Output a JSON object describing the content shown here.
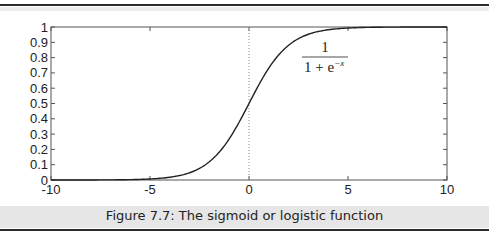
{
  "caption": "Figure 7.7: The sigmoid or logistic function",
  "formula": {
    "numerator": "1",
    "denominator_base": "1 + e",
    "denominator_exp": "−x"
  },
  "chart_data": {
    "type": "line",
    "title": "",
    "xlabel": "",
    "ylabel": "",
    "xlim": [
      -10,
      10
    ],
    "ylim": [
      0,
      1
    ],
    "x_ticks": [
      "-10",
      "-5",
      "0",
      "5",
      "10"
    ],
    "y_ticks": [
      "0",
      "0.1",
      "0.2",
      "0.3",
      "0.4",
      "0.5",
      "0.6",
      "0.7",
      "0.8",
      "0.9",
      "1"
    ],
    "grid": false,
    "legend": null,
    "annotations": [
      "1 / (1 + e^-x)",
      "dotted vertical line at x = 0"
    ],
    "series": [
      {
        "name": "sigmoid",
        "function": "1/(1+exp(-x))",
        "x": [
          -10,
          -8,
          -6,
          -5,
          -4,
          -3,
          -2,
          -1,
          0,
          1,
          2,
          3,
          4,
          5,
          6,
          8,
          10
        ],
        "values": [
          0.0,
          0.0003,
          0.0025,
          0.0067,
          0.018,
          0.047,
          0.119,
          0.269,
          0.5,
          0.731,
          0.881,
          0.953,
          0.982,
          0.9933,
          0.9975,
          0.9997,
          1.0
        ]
      }
    ],
    "colors": {
      "line": "#222222",
      "axis": "#555555"
    }
  }
}
